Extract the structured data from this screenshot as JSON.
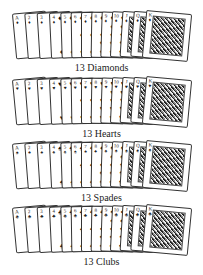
{
  "rows": [
    {
      "suit": "diamonds",
      "symbol": "♦",
      "label": "13 Diamonds",
      "ranks": [
        "A",
        "2",
        "3",
        "4",
        "5",
        "6",
        "7",
        "8",
        "9",
        "10",
        "J",
        "Q",
        "K"
      ]
    },
    {
      "suit": "hearts",
      "symbol": "♥",
      "label": "13 Hearts",
      "ranks": [
        "A",
        "2",
        "3",
        "4",
        "5",
        "6",
        "7",
        "8",
        "9",
        "10",
        "J",
        "Q",
        "K"
      ]
    },
    {
      "suit": "spades",
      "symbol": "♠",
      "label": "13 Spades",
      "ranks": [
        "A",
        "2",
        "3",
        "4",
        "5",
        "6",
        "7",
        "8",
        "9",
        "10",
        "J",
        "Q",
        "K"
      ]
    },
    {
      "suit": "clubs",
      "symbol": "♣",
      "label": "13 Clubs",
      "ranks": [
        "A",
        "2",
        "3",
        "4",
        "5",
        "6",
        "7",
        "8",
        "9",
        "10",
        "J",
        "Q",
        "K"
      ]
    }
  ]
}
